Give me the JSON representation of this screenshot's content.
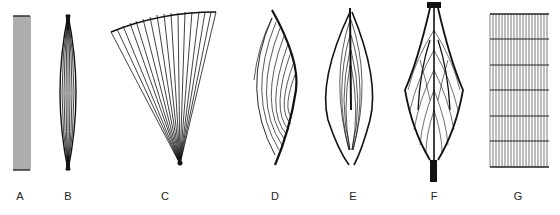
{
  "diagram": {
    "panels": [
      {
        "id": "A",
        "label": "A",
        "shape": "parallel-strap",
        "x": 20
      },
      {
        "id": "B",
        "label": "B",
        "shape": "fusiform",
        "x": 68
      },
      {
        "id": "C",
        "label": "C",
        "shape": "convergent-fan",
        "x": 165
      },
      {
        "id": "D",
        "label": "D",
        "shape": "unipennate",
        "x": 275
      },
      {
        "id": "E",
        "label": "E",
        "shape": "bipennate",
        "x": 353
      },
      {
        "id": "F",
        "label": "F",
        "shape": "multipennate",
        "x": 434
      },
      {
        "id": "G",
        "label": "G",
        "shape": "strap-with-tendinous-intersections",
        "x": 518
      }
    ],
    "colors": {
      "line": "#1a1a1a",
      "background": "#ffffff"
    }
  }
}
